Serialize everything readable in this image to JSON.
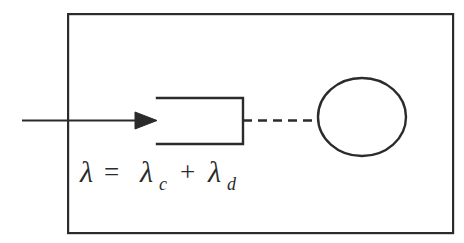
{
  "figure": {
    "background_color": "#ffffff",
    "stroke_color": "#2b2b2b",
    "outer_box": {
      "name": "system-boundary",
      "x": 67,
      "y": 13,
      "width": 385,
      "height": 219,
      "stroke_width": 2.2
    },
    "arrow": {
      "name": "arrival-arrow",
      "label": "",
      "x1": 22,
      "y1": 120,
      "x2": 157,
      "y2": 120,
      "head_length": 22,
      "head_width": 17
    },
    "open_block": {
      "name": "server-block",
      "x": 157,
      "y": 97,
      "width": 86,
      "height": 48,
      "open_side": "left",
      "stroke_width": 2.4
    },
    "dashed_link": {
      "name": "dashed-connector",
      "x1": 243,
      "y1": 120,
      "x2": 318,
      "y2": 120,
      "dash_pattern": "9 6",
      "dash_count": 5,
      "stroke_width": 2.4
    },
    "circle": {
      "name": "queue-node-circle",
      "cx": 362,
      "cy": 117,
      "rx": 44,
      "ry": 39,
      "stroke_width": 2.4
    },
    "equation": {
      "name": "lambda-equation",
      "full_text": "λ = λc + λd",
      "lambda": "λ",
      "equals": "=",
      "plus": "+",
      "subscript_c": "c",
      "subscript_d": "d",
      "x": 80,
      "baseline_y": 182
    }
  }
}
